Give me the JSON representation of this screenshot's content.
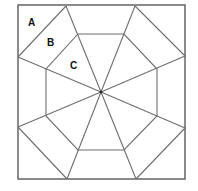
{
  "diagram": {
    "type": "geometric-quilt-block",
    "square": {
      "x1": 18,
      "y1": 5,
      "x2": 185,
      "y2": 179
    },
    "center": {
      "x": 101,
      "y": 92
    },
    "octagon": [
      [
        78,
        34
      ],
      [
        124,
        34
      ],
      [
        157,
        69
      ],
      [
        157,
        116
      ],
      [
        124,
        150
      ],
      [
        78,
        150
      ],
      [
        46,
        116
      ],
      [
        46,
        69
      ]
    ],
    "border_points": [
      [
        66,
        6
      ],
      [
        135,
        6
      ],
      [
        185,
        56
      ],
      [
        185,
        128
      ],
      [
        136,
        179
      ],
      [
        67,
        179
      ],
      [
        18,
        127
      ],
      [
        18,
        57
      ]
    ],
    "corner_diagonals": [
      [
        [
          18,
          57
        ],
        [
          66,
          6
        ]
      ],
      [
        [
          135,
          6
        ],
        [
          185,
          56
        ]
      ],
      [
        [
          185,
          128
        ],
        [
          136,
          179
        ]
      ],
      [
        [
          67,
          179
        ],
        [
          18,
          127
        ]
      ]
    ],
    "labels": [
      {
        "text": "A",
        "x": 28,
        "y": 26,
        "region": "corner-triangle"
      },
      {
        "text": "B",
        "x": 47,
        "y": 46,
        "region": "trapezoid-between-diagonal-and-octagon"
      },
      {
        "text": "C",
        "x": 70,
        "y": 69,
        "region": "triangle-inside-octagon"
      }
    ],
    "colors": {
      "line": "#6e6e6e",
      "frame": "#5a5a5a",
      "label": "#111111",
      "background": "#ffffff"
    }
  }
}
